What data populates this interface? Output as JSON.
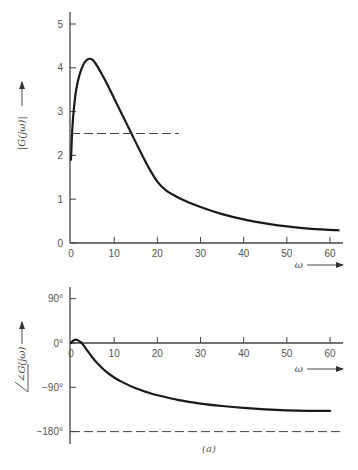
{
  "figure": {
    "caption": "(a)"
  },
  "chart_data": [
    {
      "type": "line",
      "title": "",
      "xlabel": "ω",
      "ylabel": "|G(jω)|",
      "xlim": [
        0,
        63
      ],
      "ylim": [
        0,
        5.3
      ],
      "xticks": [
        0,
        10,
        20,
        30,
        40,
        50,
        60
      ],
      "xtick_labels": [
        "0",
        "10",
        "20",
        "30",
        "40",
        "50",
        "60"
      ],
      "yticks": [
        0,
        1,
        2,
        3,
        4,
        5
      ],
      "ytick_labels": [
        "0",
        "1",
        "2",
        "3",
        "4",
        "5"
      ],
      "grid": false,
      "series": [
        {
          "name": "magnitude",
          "style": "solid",
          "x": [
            0,
            0.3,
            0.7,
            1.2,
            2,
            3,
            4,
            5,
            6,
            8,
            10,
            12,
            14,
            16,
            18,
            20,
            22,
            25,
            30,
            35,
            40,
            45,
            50,
            55,
            60,
            62
          ],
          "y": [
            1.9,
            2.6,
            3.1,
            3.5,
            3.85,
            4.1,
            4.2,
            4.18,
            4.05,
            3.7,
            3.3,
            2.9,
            2.5,
            2.1,
            1.72,
            1.4,
            1.2,
            1.03,
            0.82,
            0.66,
            0.54,
            0.45,
            0.38,
            0.33,
            0.3,
            0.29
          ]
        },
        {
          "name": "reference-2.5",
          "style": "dashed",
          "x": [
            0,
            25
          ],
          "y": [
            2.5,
            2.5
          ]
        }
      ]
    },
    {
      "type": "line",
      "title": "",
      "xlabel": "ω",
      "ylabel": "∠G(jω)",
      "xlim": [
        0,
        63
      ],
      "ylim": [
        -200,
        125
      ],
      "xticks": [
        0,
        10,
        20,
        30,
        40,
        50,
        60
      ],
      "xtick_labels": [
        "0",
        "10",
        "20",
        "30",
        "40",
        "50",
        "60"
      ],
      "yticks": [
        90,
        0,
        -90,
        -180
      ],
      "ytick_labels": [
        "90°",
        "0°",
        "−90°",
        "−180°"
      ],
      "grid": false,
      "series": [
        {
          "name": "phase",
          "style": "solid",
          "x": [
            0,
            0.5,
            1,
            1.5,
            2,
            2.5,
            3,
            4,
            5,
            6,
            8,
            10,
            12,
            15,
            18,
            20,
            25,
            30,
            35,
            40,
            45,
            50,
            55,
            60
          ],
          "y": [
            0,
            5,
            7,
            6,
            3,
            0,
            -6,
            -18,
            -30,
            -40,
            -57,
            -70,
            -80,
            -92,
            -101,
            -106,
            -116,
            -123,
            -128,
            -132,
            -135,
            -137,
            -138,
            -138
          ]
        },
        {
          "name": "reference-minus-180",
          "style": "dashed",
          "x": [
            0,
            63
          ],
          "y": [
            -180,
            -180
          ]
        }
      ]
    }
  ]
}
